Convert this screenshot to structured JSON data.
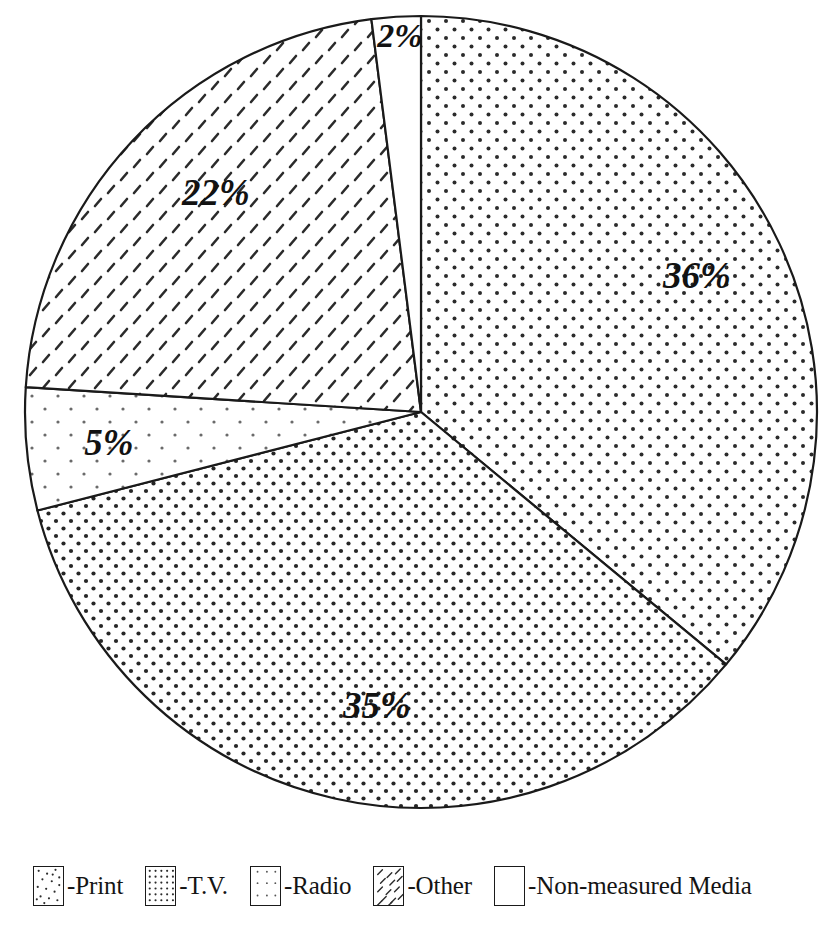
{
  "chart_data": {
    "type": "pie",
    "title": "",
    "subtitle": "",
    "xlabel": "",
    "ylabel": "",
    "unit": "%",
    "legend_position": "bottom",
    "grid": false,
    "start_angle_deg": 0,
    "direction": "clockwise",
    "categories": [
      "T.V.",
      "Print",
      "Radio",
      "Other",
      "Non-measured Media"
    ],
    "values": [
      36,
      35,
      5,
      22,
      2
    ],
    "labels": [
      "36%",
      "35%",
      "5%",
      "22%",
      "2%"
    ],
    "slices": [
      {
        "name": "T.V.",
        "value": 36,
        "label": "36%",
        "pattern": "dot-grid-medium",
        "start_deg": 0,
        "end_deg": 129.6,
        "label_x": 697,
        "label_y": 288
      },
      {
        "name": "Print",
        "value": 35,
        "label": "35%",
        "pattern": "dot-grid-dense",
        "start_deg": 129.6,
        "end_deg": 255.6,
        "label_x": 377,
        "label_y": 718
      },
      {
        "name": "Radio",
        "value": 5,
        "label": "5%",
        "pattern": "dot-grid-sparse",
        "start_deg": 255.6,
        "end_deg": 273.6,
        "label_x": 109,
        "label_y": 455
      },
      {
        "name": "Other",
        "value": 22,
        "label": "22%",
        "pattern": "diagonal-dashes",
        "start_deg": 273.6,
        "end_deg": 352.8,
        "label_x": 216,
        "label_y": 205
      },
      {
        "name": "Non-measured Media",
        "value": 2,
        "label": "2%",
        "pattern": "blank",
        "start_deg": 352.8,
        "end_deg": 360,
        "label_x": 400,
        "label_y": 47
      }
    ]
  },
  "geometry": {
    "center_x": 421,
    "center_y": 412,
    "radius": 396
  },
  "legend": {
    "items": [
      {
        "label": "-Print",
        "pattern": "scattered-dots"
      },
      {
        "label": "-T.V.",
        "pattern": "dot-grid-medium"
      },
      {
        "label": "-Radio",
        "pattern": "dot-grid-sparse"
      },
      {
        "label": "-Other",
        "pattern": "diagonal-dashes"
      },
      {
        "label": "-Non-measured Media",
        "pattern": "blank"
      }
    ]
  },
  "colors": {
    "ink": "#121212",
    "outline": "#1a1a1a",
    "background": "#ffffff"
  }
}
